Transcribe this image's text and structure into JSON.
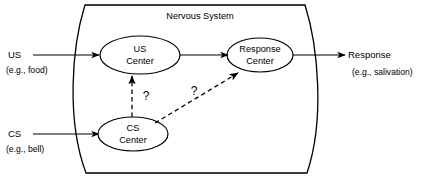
{
  "diagram": {
    "title": "Nervous System",
    "container_label": "Nervous System",
    "inputs": [
      {
        "id": "us",
        "label": "US",
        "sublabel": "(e.g., food)"
      },
      {
        "id": "cs",
        "label": "CS",
        "sublabel": "(e.g., bell)"
      }
    ],
    "nodes": [
      {
        "id": "us-center",
        "line1": "US",
        "line2": "Center"
      },
      {
        "id": "cs-center",
        "line1": "CS",
        "line2": "Center"
      },
      {
        "id": "response-center",
        "line1": "Response",
        "line2": "Center"
      }
    ],
    "output": {
      "id": "response",
      "label": "Response",
      "sublabel": "(e.g., salivation)"
    },
    "uncertain_links": [
      {
        "id": "cs-to-us-center",
        "marker": "?"
      },
      {
        "id": "cs-to-response-center",
        "marker": "?"
      }
    ],
    "colors": {
      "stroke": "#000000",
      "background": "#ffffff",
      "node_fill": "#ffffff"
    }
  }
}
